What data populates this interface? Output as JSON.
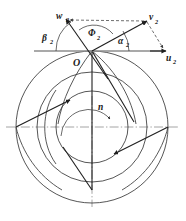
{
  "figure": {
    "type": "vector-diagram",
    "background_color": "#ffffff",
    "line_color": "#2b2b2b",
    "axis_color": "#9a9a9a"
  },
  "labels": {
    "origin": "O",
    "u_vector": "u",
    "u_vector_sub": "2",
    "v_vector": "v",
    "v_vector_sub": "2",
    "w_vector": "w",
    "w_vector_sub": "2",
    "alpha_angle": "α",
    "alpha_angle_sub": "2",
    "beta_angle": "β",
    "beta_angle_sub": "2",
    "phi_angle": "Φ",
    "phi_angle_sub": "2",
    "rotation": "n"
  },
  "geometry": {
    "origin_x": 92,
    "origin_y": 51,
    "outer_circle": {
      "cx": 92,
      "cy": 127,
      "r": 76
    },
    "middle_circle": {
      "cx": 92,
      "cy": 127,
      "r": 55
    },
    "inner_circle": {
      "cx": 92,
      "cy": 127,
      "r": 36
    },
    "u_tip_x": 166,
    "u_tip_y": 51,
    "v_tip_x": 146,
    "v_tip_y": 21,
    "w_tip_x": 66,
    "w_tip_y": 19
  },
  "annotations": {
    "rotation_direction": "clockwise",
    "vane_count": 3,
    "dash_dot_axes": [
      "horizontal",
      "vertical"
    ]
  }
}
